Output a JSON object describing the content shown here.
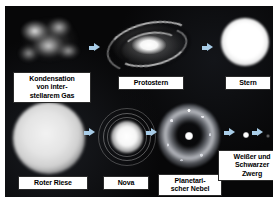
{
  "figure": {
    "language": "de",
    "background_color": "#070708",
    "arrow_color": "#a9cde8",
    "label_text_color": "#000000",
    "label_background_color": "#ffffff"
  },
  "stages": {
    "gas_cloud": {
      "label": "Kondensation\nvon inter-\nstellarem Gas",
      "icon": "gas-cloud"
    },
    "protostar": {
      "label": "Protostern",
      "icon": "spiral-disc"
    },
    "star": {
      "label": "Stern",
      "icon": "bright-sphere"
    },
    "red_giant": {
      "label": "Roter Riese",
      "icon": "large-glowing-sphere"
    },
    "nova": {
      "label": "Nova",
      "icon": "bright-core-with-shells"
    },
    "planetary_nebula": {
      "label": "Planetari-\nscher Nebel",
      "icon": "ring-nebula"
    },
    "dwarf": {
      "label": "Weißer und\nSchwarzer\nZwerg",
      "icon": "small-dot-pair"
    }
  },
  "arrows": [
    {
      "name": "gas-to-protostar",
      "direction": "right"
    },
    {
      "name": "protostar-to-star",
      "direction": "right"
    },
    {
      "name": "redgiant-to-nova",
      "direction": "right"
    },
    {
      "name": "nova-to-nebula",
      "direction": "right"
    },
    {
      "name": "nebula-to-whitedwarf",
      "direction": "right"
    },
    {
      "name": "whitedwarf-to-blackdwarf",
      "direction": "right"
    }
  ]
}
